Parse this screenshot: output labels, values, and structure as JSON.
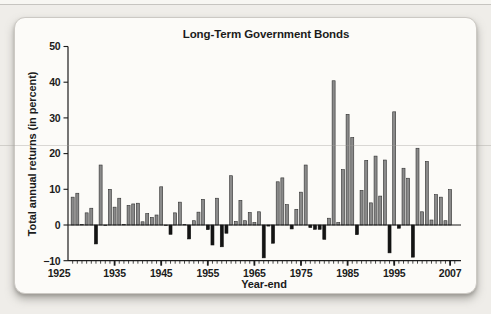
{
  "chart_data": {
    "type": "bar",
    "title": "Long-Term Government Bonds",
    "xlabel": "Year-end",
    "ylabel": "Total annual returns (in percent)",
    "ylim": [
      -10,
      50
    ],
    "y_ticks": [
      50,
      40,
      30,
      20,
      10,
      0,
      -10
    ],
    "x_ticks": [
      {
        "year": 1925,
        "label": "1925"
      },
      {
        "year": 1935,
        "label": "1935"
      },
      {
        "year": 1945,
        "label": "1945"
      },
      {
        "year": 1955,
        "label": "1955"
      },
      {
        "year": 1965,
        "label": "1965"
      },
      {
        "year": 1975,
        "label": "1975"
      },
      {
        "year": 1985,
        "label": "1985"
      },
      {
        "year": 1995,
        "label": "1995"
      },
      {
        "year": 2007,
        "label": "2007"
      }
    ],
    "x_range": [
      1925,
      2008
    ],
    "grid": false,
    "legend": "none",
    "bar_color_positive": "#8a8a8a",
    "bar_color_negative": "#141414",
    "years": [
      1926,
      1927,
      1928,
      1929,
      1930,
      1931,
      1932,
      1933,
      1934,
      1935,
      1936,
      1937,
      1938,
      1939,
      1940,
      1941,
      1942,
      1943,
      1944,
      1945,
      1946,
      1947,
      1948,
      1949,
      1950,
      1951,
      1952,
      1953,
      1954,
      1955,
      1956,
      1957,
      1958,
      1959,
      1960,
      1961,
      1962,
      1963,
      1964,
      1965,
      1966,
      1967,
      1968,
      1969,
      1970,
      1971,
      1972,
      1973,
      1974,
      1975,
      1976,
      1977,
      1978,
      1979,
      1980,
      1981,
      1982,
      1983,
      1984,
      1985,
      1986,
      1987,
      1988,
      1989,
      1990,
      1991,
      1992,
      1993,
      1994,
      1995,
      1996,
      1997,
      1998,
      1999,
      2000,
      2001,
      2002,
      2003,
      2004,
      2005,
      2006,
      2007
    ],
    "values": [
      7.8,
      8.9,
      0.1,
      3.4,
      4.7,
      -5.3,
      16.8,
      -0.1,
      10.0,
      5.0,
      7.5,
      0.2,
      5.5,
      5.9,
      6.1,
      0.9,
      3.2,
      2.1,
      2.8,
      10.7,
      -0.1,
      -2.6,
      3.4,
      6.4,
      0.1,
      -3.9,
      1.2,
      3.6,
      7.2,
      -1.3,
      -5.6,
      7.5,
      -6.1,
      -2.3,
      13.8,
      1.0,
      6.9,
      1.2,
      3.5,
      0.7,
      3.7,
      -9.2,
      -0.3,
      -5.1,
      12.1,
      13.2,
      5.7,
      -1.1,
      4.4,
      9.2,
      16.8,
      -0.7,
      -1.2,
      -1.2,
      -4.0,
      1.9,
      40.4,
      0.7,
      15.5,
      31.0,
      24.5,
      -2.7,
      9.7,
      18.1,
      6.2,
      19.3,
      8.1,
      18.2,
      -7.8,
      31.7,
      -0.9,
      15.9,
      13.1,
      -9.0,
      21.5,
      3.7,
      17.8,
      1.4,
      8.5,
      7.8,
      1.2,
      9.9
    ]
  }
}
